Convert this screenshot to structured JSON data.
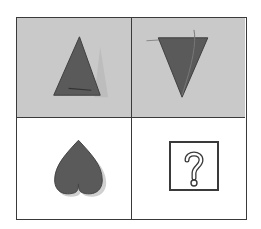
{
  "puzzle": {
    "colors": {
      "top_row_bg": "#c9c9c9",
      "bottom_row_bg": "#ffffff",
      "shape_fill": "#5a5a5a",
      "border": "#3a3a3a"
    },
    "cells": [
      {
        "row": 0,
        "col": 0,
        "shape": "triangle-up"
      },
      {
        "row": 0,
        "col": 1,
        "shape": "triangle-down"
      },
      {
        "row": 1,
        "col": 0,
        "shape": "heart-inverted"
      },
      {
        "row": 1,
        "col": 1,
        "shape": "question-mark-box",
        "label": "?"
      }
    ]
  }
}
